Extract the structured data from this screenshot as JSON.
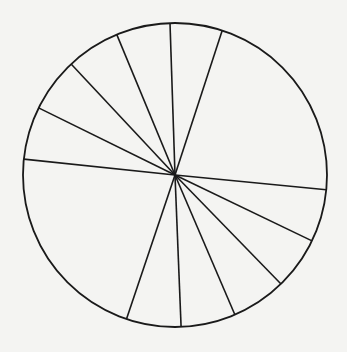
{
  "chart_data": {
    "type": "pie",
    "title": "",
    "labels": [],
    "start_angle_deg": 18.1,
    "direction": "clockwise",
    "slices_deg": [
      77.5,
      20.1,
      20.1,
      21.0,
      20.9,
      20.9,
      77.4,
      20.2,
      20.7,
      20.6,
      20.6,
      20.0
    ],
    "values_pct": [
      21.5,
      5.6,
      5.6,
      5.8,
      5.8,
      5.8,
      21.5,
      5.6,
      5.8,
      5.7,
      5.7,
      5.6
    ],
    "legend": "none",
    "fill": "none",
    "stroke_color": "#1a1a1a",
    "background_color": "#f4f4f2"
  },
  "geometry": {
    "cx": 175,
    "cy": 175,
    "r": 152
  }
}
